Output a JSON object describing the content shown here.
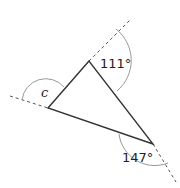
{
  "diagram": {
    "type": "triangle-exterior-angles",
    "angles": {
      "top": "111°",
      "right": "147°",
      "left": "c"
    },
    "colors": {
      "triangle": "#333333",
      "dashed": "#555555",
      "arc": "#999999"
    }
  }
}
